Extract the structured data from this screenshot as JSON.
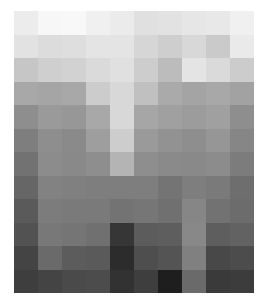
{
  "image": {
    "description": "Pixelated grayscale mosaic (10 columns x 12 rows)",
    "columns": 10,
    "rows": 12,
    "cells": [
      [
        "#ececec",
        "#f7f7f7",
        "#f8f8f8",
        "#f0f0f0",
        "#ebebeb",
        "#e0e0e0",
        "#e2e2e2",
        "#e6e6e6",
        "#e8e8e8",
        "#f0f0f0"
      ],
      [
        "#e2e2e2",
        "#dcdcdc",
        "#dedede",
        "#e4e4e4",
        "#e4e4e4",
        "#d6d6d6",
        "#cecece",
        "#d8d8d8",
        "#cacaca",
        "#eaeaea"
      ],
      [
        "#c6c6c6",
        "#cfcfcf",
        "#d2d2d2",
        "#dadada",
        "#e0e0e0",
        "#cdcdcd",
        "#bcbcbc",
        "#e4e4e4",
        "#dadada",
        "#cccccc"
      ],
      [
        "#a8a8a8",
        "#a5a5a5",
        "#a8a8a8",
        "#cccccc",
        "#d8d8d8",
        "#c0c0c0",
        "#aaaaaa",
        "#a4a4a4",
        "#a8a8a8",
        "#a2a2a2"
      ],
      [
        "#8e8e8e",
        "#9a9a9a",
        "#979797",
        "#a8a8a8",
        "#d8d8d8",
        "#a6a6a6",
        "#a0a0a0",
        "#9c9c9c",
        "#a0a0a0",
        "#8e8e8e"
      ],
      [
        "#7e7e7e",
        "#8e8e8e",
        "#8a8a8a",
        "#9e9e9e",
        "#cdcdcd",
        "#9a9a9a",
        "#929292",
        "#8e8e8e",
        "#969696",
        "#868686"
      ],
      [
        "#727272",
        "#8c8c8c",
        "#898989",
        "#8e8e8e",
        "#b4b4b4",
        "#8e8e8e",
        "#8a8a8a",
        "#898989",
        "#8c8c8c",
        "#7c7c7c"
      ],
      [
        "#666666",
        "#828282",
        "#808080",
        "#7e7e7e",
        "#7e7e7e",
        "#7e7e7e",
        "#747474",
        "#7e7e7e",
        "#7a7a7a",
        "#6e6e6e"
      ],
      [
        "#5a5a5a",
        "#7c7c7c",
        "#7a7a7a",
        "#7a7a7a",
        "#737373",
        "#767676",
        "#707070",
        "#868686",
        "#727272",
        "#6c6c6c"
      ],
      [
        "#525252",
        "#787878",
        "#757575",
        "#707070",
        "#363636",
        "#5c5c5c",
        "#5e5e5e",
        "#888888",
        "#5e5e5e",
        "#626262"
      ],
      [
        "#444444",
        "#6a6a6a",
        "#5c5c5c",
        "#5a5a5a",
        "#2c2c2c",
        "#4e4e4e",
        "#545454",
        "#808080",
        "#484848",
        "#4c4c4c"
      ],
      [
        "#3e3e3e",
        "#444444",
        "#4a4a4a",
        "#4c4c4c",
        "#323232",
        "#3e3e3e",
        "#1e1e1e",
        "#6a6a6a",
        "#3a3a3a",
        "#3c3c3c"
      ]
    ]
  }
}
